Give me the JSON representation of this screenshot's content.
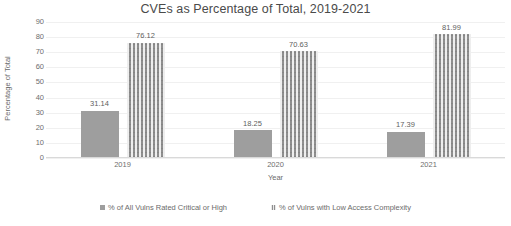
{
  "chart_data": {
    "type": "bar",
    "title": "CVEs as Percentage of Total, 2019-2021",
    "xlabel": "Year",
    "ylabel": "Percentage of Total",
    "categories": [
      "2019",
      "2020",
      "2021"
    ],
    "series": [
      {
        "name": "% of All Vulns Rated Critical or High",
        "values": [
          31.14,
          18.25,
          17.39
        ],
        "labels": [
          "31.14",
          "18.25",
          "17.39"
        ],
        "color": "#9e9e9e",
        "fill": "solid"
      },
      {
        "name": "% of Vulns with Low Access Complexity",
        "values": [
          76.12,
          70.63,
          81.99
        ],
        "labels": [
          "76.12",
          "70.63",
          "81.99"
        ],
        "color": "#8f8f8f",
        "fill": "pattern-small-checker"
      }
    ],
    "ylim": [
      0,
      90
    ],
    "yticks": [
      0,
      10,
      20,
      30,
      40,
      50,
      60,
      70,
      80,
      90
    ],
    "ytick_labels": [
      "0",
      "10",
      "20",
      "30",
      "40",
      "50",
      "60",
      "70",
      "80",
      "90"
    ],
    "grid": true,
    "grid_axis": "y",
    "legend_position": "bottom",
    "data_labels": true,
    "background": "#ffffff"
  },
  "legend": {
    "items": [
      {
        "label": "% of All Vulns Rated Critical or High",
        "marker": "square-solid"
      },
      {
        "label": "% of Vulns with Low Access Complexity",
        "marker": "square-pattern"
      }
    ]
  }
}
